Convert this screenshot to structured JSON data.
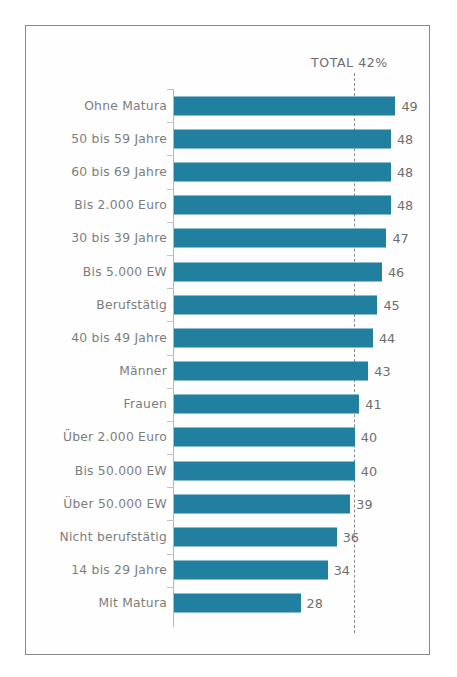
{
  "chart_data": {
    "type": "bar",
    "orientation": "horizontal",
    "title": "",
    "xlabel": "",
    "ylabel": "",
    "xlim": [
      0,
      55
    ],
    "grid": false,
    "legend": null,
    "annotations": [
      {
        "name": "total-reference",
        "text": "TOTAL 42%",
        "value": 42,
        "style": "dashed-vertical-line"
      }
    ],
    "value_unit": "%",
    "bar_color": "#2180a0",
    "categories": [
      "Ohne Matura",
      "50 bis 59 Jahre",
      "60 bis 69 Jahre",
      "Bis 2.000 Euro",
      "30 bis 39 Jahre",
      "Bis 5.000 EW",
      "Berufstätig",
      "40 bis 49 Jahre",
      "Männer",
      "Frauen",
      "Über 2.000 Euro",
      "Bis 50.000 EW",
      "Über 50.000 EW",
      "Nicht berufstätig",
      "14 bis 29 Jahre",
      "Mit Matura"
    ],
    "values": [
      49,
      48,
      48,
      48,
      47,
      46,
      45,
      44,
      43,
      41,
      40,
      40,
      39,
      36,
      34,
      28
    ]
  },
  "annotation": {
    "total_label": "TOTAL 42%"
  },
  "rows": [
    {
      "label": "Ohne Matura",
      "value": 49,
      "value_text": "49"
    },
    {
      "label": "50 bis 59 Jahre",
      "value": 48,
      "value_text": "48"
    },
    {
      "label": "60 bis 69 Jahre",
      "value": 48,
      "value_text": "48"
    },
    {
      "label": "Bis 2.000 Euro",
      "value": 48,
      "value_text": "48"
    },
    {
      "label": "30 bis 39 Jahre",
      "value": 47,
      "value_text": "47"
    },
    {
      "label": "Bis 5.000 EW",
      "value": 46,
      "value_text": "46"
    },
    {
      "label": "Berufstätig",
      "value": 45,
      "value_text": "45"
    },
    {
      "label": "40 bis 49 Jahre",
      "value": 44,
      "value_text": "44"
    },
    {
      "label": "Männer",
      "value": 43,
      "value_text": "43"
    },
    {
      "label": "Frauen",
      "value": 41,
      "value_text": "41"
    },
    {
      "label": "Über 2.000 Euro",
      "value": 40,
      "value_text": "40"
    },
    {
      "label": "Bis 50.000 EW",
      "value": 40,
      "value_text": "40"
    },
    {
      "label": "Über 50.000 EW",
      "value": 39,
      "value_text": "39"
    },
    {
      "label": "Nicht berufstätig",
      "value": 36,
      "value_text": "36"
    },
    {
      "label": "14 bis 29 Jahre",
      "value": 34,
      "value_text": "34"
    },
    {
      "label": "Mit Matura",
      "value": 28,
      "value_text": "28"
    }
  ],
  "scale": {
    "px_per_unit": 4.52,
    "reference_value": 42
  }
}
